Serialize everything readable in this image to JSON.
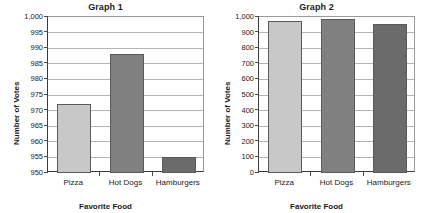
{
  "charts": [
    {
      "title": "Graph 1",
      "ylabel": "Number of Votes",
      "xlabel": "Favorite Food",
      "yticks": [
        "1,000",
        "995",
        "990",
        "985",
        "980",
        "975",
        "970",
        "965",
        "960",
        "955",
        "950"
      ],
      "categories": [
        "Pizza",
        "Hot Dogs",
        "Hamburgers"
      ],
      "values": [
        972,
        988,
        955
      ],
      "ymin": 950,
      "ymax": 1000,
      "colors": [
        "#c8c8c8",
        "#808080",
        "#6b6b6b"
      ]
    },
    {
      "title": "Graph 2",
      "ylabel": "Number of Votes",
      "xlabel": "Favorite Food",
      "yticks": [
        "1,000",
        "900",
        "800",
        "700",
        "600",
        "500",
        "400",
        "300",
        "200",
        "100",
        "0"
      ],
      "categories": [
        "Pizza",
        "Hot Dogs",
        "Hamburgers"
      ],
      "values": [
        972,
        988,
        955
      ],
      "ymin": 0,
      "ymax": 1000,
      "colors": [
        "#c8c8c8",
        "#808080",
        "#6b6b6b"
      ]
    }
  ],
  "chart_data": [
    {
      "type": "bar",
      "title": "Graph 1",
      "xlabel": "Favorite Food",
      "ylabel": "Number of Votes",
      "categories": [
        "Pizza",
        "Hot Dogs",
        "Hamburgers"
      ],
      "values": [
        972,
        988,
        955
      ],
      "ylim": [
        950,
        1000
      ],
      "ytick_values": [
        950,
        955,
        960,
        965,
        970,
        975,
        980,
        985,
        990,
        995,
        1000
      ],
      "ytick_labels": [
        "950",
        "955",
        "960",
        "965",
        "970",
        "975",
        "980",
        "985",
        "990",
        "995",
        "1,000"
      ],
      "grid": true,
      "legend": "none",
      "bar_colors": [
        "#c8c8c8",
        "#808080",
        "#6b6b6b"
      ]
    },
    {
      "type": "bar",
      "title": "Graph 2",
      "xlabel": "Favorite Food",
      "ylabel": "Number of Votes",
      "categories": [
        "Pizza",
        "Hot Dogs",
        "Hamburgers"
      ],
      "values": [
        972,
        988,
        955
      ],
      "ylim": [
        0,
        1000
      ],
      "ytick_values": [
        0,
        100,
        200,
        300,
        400,
        500,
        600,
        700,
        800,
        900,
        1000
      ],
      "ytick_labels": [
        "0",
        "100",
        "200",
        "300",
        "400",
        "500",
        "600",
        "700",
        "800",
        "900",
        "1,000"
      ],
      "grid": true,
      "legend": "none",
      "bar_colors": [
        "#c8c8c8",
        "#808080",
        "#6b6b6b"
      ]
    }
  ]
}
